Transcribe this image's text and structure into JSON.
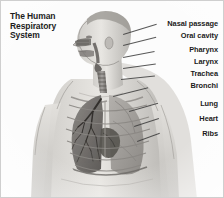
{
  "figure": {
    "title_lines": [
      "The Human",
      "Respiratory",
      "System"
    ],
    "background_color": "#fdfdfd",
    "border_color": "#cfcfcf",
    "ink_color": "#1a1a1a",
    "style": "grayscale anatomical illustration, male torso in three-quarter view with cutaway chest showing lungs, trachea and ribcage"
  },
  "labels": [
    {
      "name": "nasal-passage",
      "text": "Nasal passage",
      "right": 5,
      "top": 19
    },
    {
      "name": "oral-cavity",
      "text": "Oral cavity",
      "right": 5,
      "top": 31
    },
    {
      "name": "pharynx",
      "text": "Pharynx",
      "right": 5,
      "top": 45
    },
    {
      "name": "larynx",
      "text": "Larynx",
      "right": 5,
      "top": 57
    },
    {
      "name": "trachea",
      "text": "Trachea",
      "right": 5,
      "top": 69
    },
    {
      "name": "bronchi",
      "text": "Bronchi",
      "right": 5,
      "top": 81
    },
    {
      "name": "lung",
      "text": "Lung",
      "right": 5,
      "top": 99
    },
    {
      "name": "heart",
      "text": "Heart",
      "right": 5,
      "top": 114
    },
    {
      "name": "ribs",
      "text": "Ribs",
      "right": 5,
      "top": 129
    }
  ],
  "leaders": [
    {
      "name": "leader-nasal-passage",
      "x": 122,
      "y": 33,
      "len": 35,
      "angle": -17
    },
    {
      "name": "leader-oral-cavity",
      "x": 122,
      "y": 44,
      "len": 34,
      "angle": -14
    },
    {
      "name": "leader-pharynx",
      "x": 122,
      "y": 56,
      "len": 32,
      "angle": -11
    },
    {
      "name": "leader-larynx",
      "x": 122,
      "y": 67,
      "len": 33,
      "angle": -8
    },
    {
      "name": "leader-trachea",
      "x": 120,
      "y": 78,
      "len": 34,
      "angle": -6
    },
    {
      "name": "leader-bronchi",
      "x": 112,
      "y": 95,
      "len": 36,
      "angle": -14
    },
    {
      "name": "leader-lung",
      "x": 128,
      "y": 110,
      "len": 30,
      "angle": -16
    },
    {
      "name": "leader-heart",
      "x": 133,
      "y": 125,
      "len": 26,
      "angle": -18
    },
    {
      "name": "leader-ribs",
      "x": 136,
      "y": 140,
      "len": 24,
      "angle": -20
    }
  ]
}
